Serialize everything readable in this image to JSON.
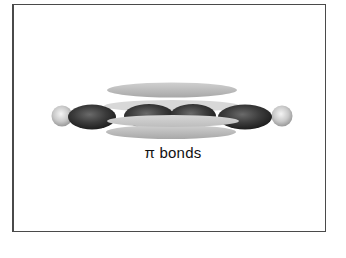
{
  "diagram": {
    "caption": "π bonds",
    "elements": [
      {
        "type": "hydrogen-atom",
        "side": "left",
        "color": "#c8c8c8"
      },
      {
        "type": "sigma-lobe",
        "index": 1,
        "color": "#3a3a3a"
      },
      {
        "type": "sigma-lobe",
        "index": 2,
        "color": "#3a3a3a"
      },
      {
        "type": "sigma-lobe",
        "index": 3,
        "color": "#3a3a3a"
      },
      {
        "type": "sigma-lobe",
        "index": 4,
        "color": "#3a3a3a"
      },
      {
        "type": "hydrogen-atom",
        "side": "right",
        "color": "#c8c8c8"
      },
      {
        "type": "pi-lobe",
        "position": "top",
        "color": "#bdbdbd"
      },
      {
        "type": "pi-lobe",
        "position": "middle",
        "color": "#c4c4c4"
      },
      {
        "type": "pi-lobe",
        "position": "bottom",
        "color": "#b8b8b8"
      }
    ],
    "colors": {
      "frame_border": "#4a4a4a",
      "background": "#ffffff",
      "dark_lobe": "#3a3a3a",
      "light_lobe": "#bdbdbd",
      "text": "#111111"
    }
  }
}
